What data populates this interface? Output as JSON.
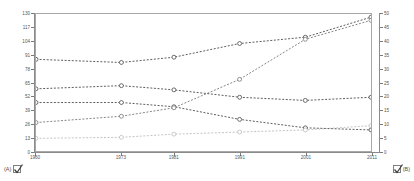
{
  "chart_data": {
    "type": "line",
    "title": "",
    "xlabel": "",
    "ylabel": "",
    "y2label": "",
    "grid": false,
    "legend_position": "none",
    "x": [
      1960,
      1973,
      1981,
      1991,
      2001,
      2011
    ],
    "categories": [
      "1960",
      "1973",
      "1981",
      "1991",
      "2001",
      "2011"
    ],
    "xlim": [
      1960,
      2011
    ],
    "ylim": [
      0,
      130
    ],
    "y2lim": [
      0,
      50
    ],
    "yticks": [
      0,
      13,
      26,
      39,
      52,
      65,
      78,
      91,
      104,
      117,
      130
    ],
    "y2ticks": [
      0,
      5,
      10,
      15,
      20,
      25,
      30,
      35,
      40,
      45,
      50
    ],
    "ytick_labels": [
      "0",
      "13",
      "26",
      "39",
      "52",
      "65",
      "78",
      "91",
      "104",
      "117",
      "130"
    ],
    "y2tick_labels": [
      "0",
      "5",
      "10",
      "15",
      "20",
      "25",
      "30",
      "35",
      "40",
      "45",
      "50"
    ],
    "series": [
      {
        "name": "series-1",
        "axis": "left",
        "color": "#4a4a4a",
        "style": "dashed",
        "marker": "circle-open",
        "values": [
          87,
          84,
          89,
          102,
          108,
          127
        ]
      },
      {
        "name": "series-2",
        "axis": "left",
        "color": "#4a4a4a",
        "style": "dashed",
        "marker": "circle-open",
        "values": [
          59,
          62,
          58,
          51,
          48,
          51
        ]
      },
      {
        "name": "series-3",
        "axis": "left",
        "color": "#4a4a4a",
        "style": "dashed",
        "marker": "circle-open",
        "values": [
          46,
          46,
          42,
          30,
          22,
          20
        ]
      },
      {
        "name": "series-4",
        "axis": "left",
        "color": "#777777",
        "style": "dashed",
        "marker": "circle-open",
        "values": [
          27,
          33,
          41,
          68,
          106,
          124
        ]
      },
      {
        "name": "series-5",
        "axis": "left",
        "color": "#bdbdbd",
        "style": "dashed",
        "marker": "circle-open",
        "values": [
          12,
          13,
          16,
          18,
          20,
          24
        ]
      }
    ]
  },
  "controls": {
    "left_toggle": {
      "label": "(A)",
      "checked": true,
      "icon": "checkbox-checked-icon"
    },
    "right_toggle": {
      "label": "(B)",
      "checked": true,
      "icon": "checkbox-checked-icon"
    }
  }
}
